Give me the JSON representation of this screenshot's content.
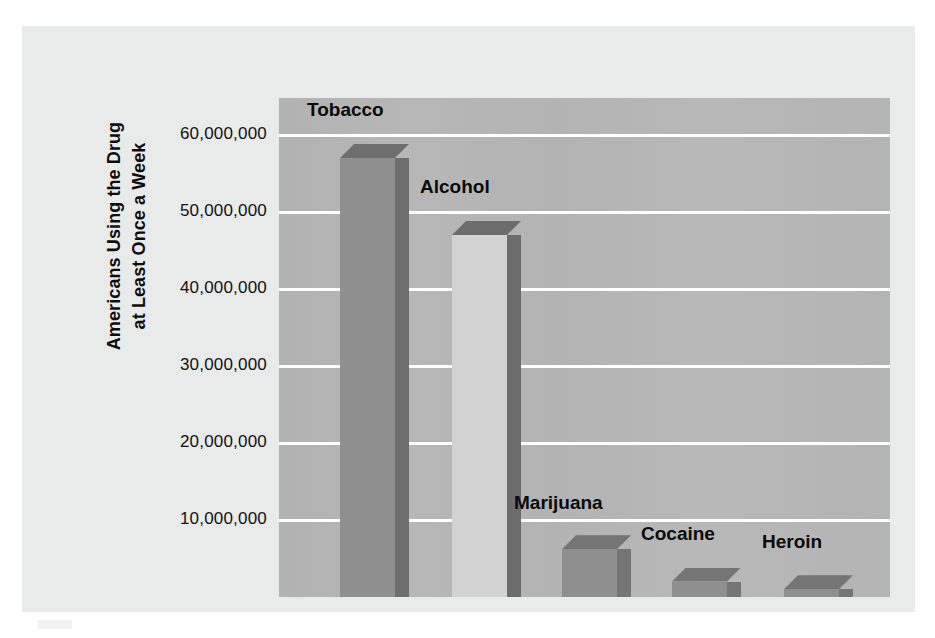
{
  "chart_data": {
    "type": "bar",
    "title": "",
    "subtitle": "",
    "xlabel": "",
    "ylabel": "Americans Using the Drug at Least Once a Week",
    "ylabel_line1": "Americans Using the Drug",
    "ylabel_line2": "at Least Once a Week",
    "categories": [
      "Tobacco",
      "Alcohol",
      "Marijuana",
      "Cocaine",
      "Heroin"
    ],
    "values": [
      57000000,
      47000000,
      6200000,
      2000000,
      1000000
    ],
    "value_labels": [
      "57,000,000",
      "47,000,000",
      "6,200,000",
      "2,000,000",
      "1,000,000"
    ],
    "ylim": [
      0,
      64800000
    ],
    "ytick_values": [
      60000000,
      50000000,
      40000000,
      30000000,
      20000000,
      10000000
    ],
    "ytick_labels": [
      "60,000,000",
      "50,000,000",
      "40,000,000",
      "30,000,000",
      "20,000,000",
      "10,000,000"
    ],
    "grid": true,
    "gridline_color": "#ffffff",
    "legend": false,
    "legend_position": "none",
    "bar_style": "3d",
    "plot_background": "#b5b5b5",
    "panel_background": "#e9eaea",
    "series": [
      {
        "name": "Americans Using the Drug at Least Once a Week",
        "values": [
          57000000,
          47000000,
          6200000,
          2000000,
          1000000
        ]
      }
    ],
    "bars": [
      {
        "label": "Tobacco",
        "value": 57000000,
        "face_color": "#8f8f8f",
        "side_color": "#6e6e6e",
        "label_x": 307,
        "label_y": 99
      },
      {
        "label": "Alcohol",
        "value": 47000000,
        "face_color": "#d2d2d2",
        "side_color": "#6c6c6c",
        "label_x": 420,
        "label_y": 176
      },
      {
        "label": "Marijuana",
        "value": 6200000,
        "face_color": "#8f8f8f",
        "side_color": "#757575",
        "label_x": 514,
        "label_y": 492
      },
      {
        "label": "Cocaine",
        "value": 2000000,
        "face_color": "#8f8f8f",
        "side_color": "#757575",
        "label_x": 641,
        "label_y": 523
      },
      {
        "label": "Heroin",
        "value": 1000000,
        "face_color": "#8f8f8f",
        "side_color": "#757575",
        "label_x": 762,
        "label_y": 531
      }
    ]
  }
}
